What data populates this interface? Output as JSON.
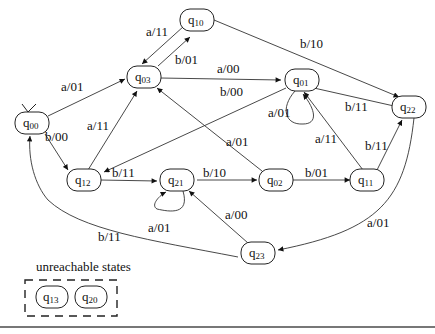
{
  "diagram": {
    "type": "state-machine",
    "initial_state": "q00",
    "states": [
      {
        "id": "q00",
        "base": "q",
        "sub": "00",
        "x": 32,
        "y": 123
      },
      {
        "id": "q03",
        "base": "q",
        "sub": "03",
        "x": 144,
        "y": 77
      },
      {
        "id": "q10",
        "base": "q",
        "sub": "10",
        "x": 197,
        "y": 20
      },
      {
        "id": "q01",
        "base": "q",
        "sub": "01",
        "x": 302,
        "y": 80
      },
      {
        "id": "q22",
        "base": "q",
        "sub": "22",
        "x": 409,
        "y": 107
      },
      {
        "id": "q12",
        "base": "q",
        "sub": "12",
        "x": 84,
        "y": 180
      },
      {
        "id": "q21",
        "base": "q",
        "sub": "21",
        "x": 177,
        "y": 180
      },
      {
        "id": "q02",
        "base": "q",
        "sub": "02",
        "x": 276,
        "y": 180
      },
      {
        "id": "q11",
        "base": "q",
        "sub": "11",
        "x": 367,
        "y": 180
      },
      {
        "id": "q23",
        "base": "q",
        "sub": "23",
        "x": 258,
        "y": 253
      }
    ],
    "edges": [
      {
        "from": "q00",
        "to": "q03",
        "label": "a/01"
      },
      {
        "from": "q00",
        "to": "q12",
        "label": "b/00"
      },
      {
        "from": "q03",
        "to": "q10",
        "label": "b/01"
      },
      {
        "from": "q10",
        "to": "q03",
        "label": "a/11"
      },
      {
        "from": "q03",
        "to": "q01",
        "label": "a/00"
      },
      {
        "from": "q10",
        "to": "q22",
        "label": "b/10"
      },
      {
        "from": "q01",
        "to": "q12",
        "label": "b/00"
      },
      {
        "from": "q01",
        "to": "q01",
        "label": "a/01"
      },
      {
        "from": "q22",
        "to": "q01",
        "label": "b/11"
      },
      {
        "from": "q11",
        "to": "q01",
        "label": "a/11"
      },
      {
        "from": "q11",
        "to": "q22",
        "label": "b/11"
      },
      {
        "from": "q22",
        "to": "q23",
        "label": "a/01"
      },
      {
        "from": "q12",
        "to": "q03",
        "label": "a/11"
      },
      {
        "from": "q12",
        "to": "q21",
        "label": "b/11"
      },
      {
        "from": "q21",
        "to": "q21",
        "label": "a/01"
      },
      {
        "from": "q21",
        "to": "q02",
        "label": "b/10"
      },
      {
        "from": "q02",
        "to": "q03",
        "label": "a/01"
      },
      {
        "from": "q02",
        "to": "q11",
        "label": "b/01"
      },
      {
        "from": "q23",
        "to": "q21",
        "label": "a/00"
      },
      {
        "from": "q23",
        "to": "q00",
        "label": "b/11"
      }
    ],
    "unreachable": {
      "caption": "unreachable states",
      "states": [
        {
          "id": "q13",
          "base": "q",
          "sub": "13"
        },
        {
          "id": "q20",
          "base": "q",
          "sub": "20"
        }
      ]
    }
  }
}
